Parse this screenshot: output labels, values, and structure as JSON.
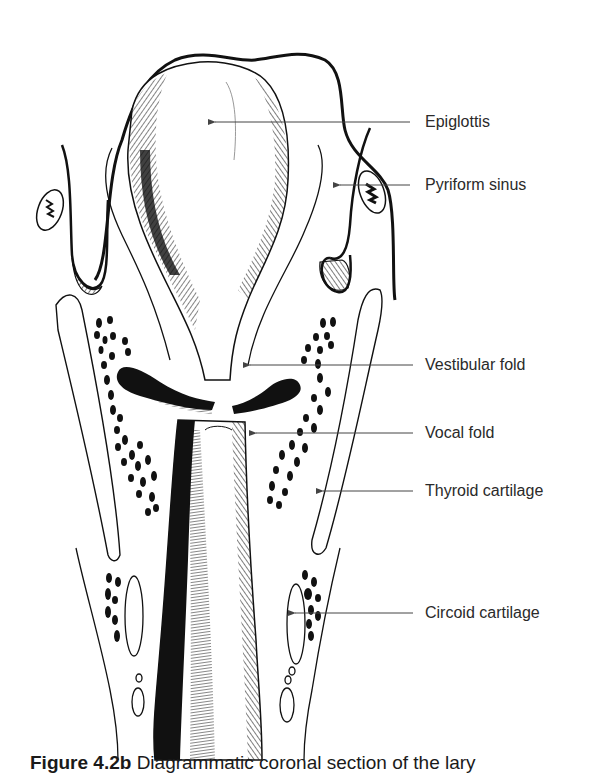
{
  "figure": {
    "number": "Figure 4.2b",
    "caption": "Diagrammatic coronal section of the lary"
  },
  "labels": [
    {
      "id": "epiglottis",
      "text": "Epiglottis",
      "x": 425,
      "y": 113,
      "line": {
        "x1": 212,
        "x2": 410,
        "y": 122
      }
    },
    {
      "id": "pyriform-sinus",
      "text": "Pyriform sinus",
      "x": 425,
      "y": 176,
      "line": {
        "x1": 337,
        "x2": 410,
        "y": 185
      }
    },
    {
      "id": "vestibular-fold",
      "text": "Vestibular fold",
      "x": 425,
      "y": 356,
      "line": {
        "x1": 247,
        "x2": 413,
        "y": 365
      }
    },
    {
      "id": "vocal-fold",
      "text": "Vocal fold",
      "x": 425,
      "y": 424,
      "line": {
        "x1": 253,
        "x2": 413,
        "y": 433
      }
    },
    {
      "id": "thyroid-cartilage",
      "text": "Thyroid cartilage",
      "x": 425,
      "y": 482,
      "line": {
        "x1": 320,
        "x2": 413,
        "y": 491
      }
    },
    {
      "id": "circoid-cartilage",
      "text": "Circoid cartilage",
      "x": 425,
      "y": 604,
      "line": {
        "x1": 292,
        "x2": 413,
        "y": 613
      }
    }
  ],
  "colors": {
    "ink": "#111111",
    "leader": "#444444",
    "text": "#2a2a2a",
    "background": "#ffffff"
  }
}
